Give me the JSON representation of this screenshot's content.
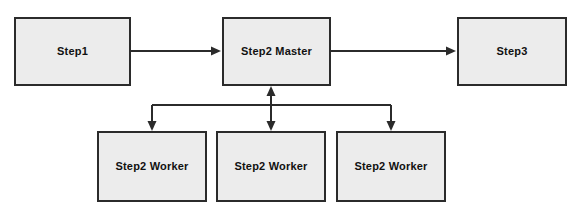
{
  "diagram": {
    "background_color": "#ffffff",
    "node_fill_color": "#ececec",
    "node_border_color": "#2b2b2b",
    "edge_color": "#2b2b2b",
    "nodes": [
      {
        "id": "step1",
        "label": "Step1"
      },
      {
        "id": "step2_master",
        "label": "Step2 Master"
      },
      {
        "id": "step3",
        "label": "Step3"
      },
      {
        "id": "worker1",
        "label": "Step2 Worker"
      },
      {
        "id": "worker2",
        "label": "Step2 Worker"
      },
      {
        "id": "worker3",
        "label": "Step2 Worker"
      }
    ],
    "edges": [
      {
        "id": "e1",
        "from": "step1",
        "to": "step2_master",
        "arrows": "single"
      },
      {
        "id": "e2",
        "from": "step2_master",
        "to": "step3",
        "arrows": "single"
      },
      {
        "id": "e3",
        "from": "step2_master",
        "to": "worker1",
        "arrows": "single"
      },
      {
        "id": "e4",
        "from": "step2_master",
        "to": "worker2",
        "arrows": "double"
      },
      {
        "id": "e5",
        "from": "step2_master",
        "to": "worker3",
        "arrows": "single"
      }
    ]
  }
}
